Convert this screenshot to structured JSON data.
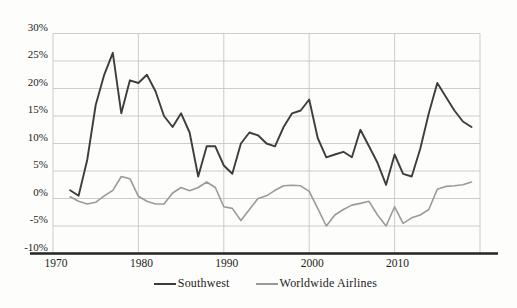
{
  "figure": {
    "background": "#fdfdfb",
    "title": "",
    "legend": [
      {
        "label": "Southwest",
        "color": "#3d3d3f"
      },
      {
        "label": "Worldwide Airlines",
        "color": "#9a9a9a"
      }
    ]
  },
  "chart_data": {
    "type": "line",
    "title": "",
    "xlabel": "",
    "ylabel": "",
    "grid": true,
    "legend_position": "bottom",
    "xlim": [
      1970,
      2020
    ],
    "ylim": [
      -10,
      30
    ],
    "x_ticks": [
      {
        "value": 1970,
        "label": "1970"
      },
      {
        "value": 1980,
        "label": "1980"
      },
      {
        "value": 1990,
        "label": "1990"
      },
      {
        "value": 2000,
        "label": "2000"
      },
      {
        "value": 2010,
        "label": "2010"
      }
    ],
    "y_ticks": [
      {
        "value": 30,
        "label": "30%"
      },
      {
        "value": 25,
        "label": "25%"
      },
      {
        "value": 20,
        "label": "20%"
      },
      {
        "value": 15,
        "label": "15%"
      },
      {
        "value": 10,
        "label": "10%"
      },
      {
        "value": 5,
        "label": "5%"
      },
      {
        "value": 0,
        "label": "0%"
      },
      {
        "value": -5,
        "label": "-5%"
      },
      {
        "value": -10,
        "label": "-10%"
      }
    ],
    "x": [
      1972,
      1973,
      1974,
      1975,
      1976,
      1977,
      1978,
      1979,
      1980,
      1981,
      1982,
      1983,
      1984,
      1985,
      1986,
      1987,
      1988,
      1989,
      1990,
      1991,
      1992,
      1993,
      1994,
      1995,
      1996,
      1997,
      1998,
      1999,
      2000,
      2001,
      2002,
      2003,
      2004,
      2005,
      2006,
      2007,
      2008,
      2009,
      2010,
      2011,
      2012,
      2013,
      2014,
      2015,
      2016,
      2017,
      2018,
      2019
    ],
    "series": [
      {
        "name": "Southwest",
        "color": "#3d3d3f",
        "stroke_width": 1.9,
        "values": [
          1.5,
          0.5,
          7,
          17,
          22.5,
          26.5,
          15.5,
          21.5,
          21,
          22.5,
          19.5,
          15,
          13,
          15.5,
          12,
          4,
          9.5,
          9.5,
          6,
          4.5,
          10,
          12,
          11.5,
          10,
          9.5,
          13,
          15.5,
          16,
          18,
          11,
          7.5,
          8,
          8.5,
          7.5,
          12.5,
          9.5,
          6.5,
          2.5,
          8,
          4.5,
          4,
          9,
          15.5,
          21,
          18.5,
          16,
          14,
          13
        ]
      },
      {
        "name": "Worldwide Airlines",
        "color": "#9a9a9a",
        "stroke_width": 1.6,
        "values": [
          0.3,
          -0.5,
          -1,
          -0.7,
          0.5,
          1.5,
          4,
          3.6,
          0.4,
          -0.5,
          -1,
          -1,
          1,
          2,
          1.4,
          2,
          3,
          2,
          -1.5,
          -1.8,
          -4,
          -2,
          0,
          0.5,
          1.5,
          2.3,
          2.4,
          2.3,
          1.3,
          -1.8,
          -5,
          -3,
          -2,
          -1.2,
          -0.9,
          -0.5,
          -3,
          -5,
          -1.5,
          -4.5,
          -3.5,
          -3,
          -2,
          1.7,
          2.2,
          2.3,
          2.5,
          3
        ]
      }
    ],
    "colors": {
      "gridline": "#c7c7c4",
      "axis": "#232323",
      "tick_text": "#1c1c1c"
    }
  }
}
